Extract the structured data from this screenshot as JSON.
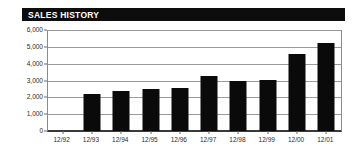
{
  "panel": {
    "title": "SALES HISTORY",
    "title_bar_color": "#0d0d0d",
    "title_text_color": "#ffffff",
    "background": "#ffffff"
  },
  "chart_data": {
    "type": "bar",
    "title": "SALES HISTORY",
    "xlabel": "",
    "ylabel": "",
    "categories": [
      "12/92",
      "12/93",
      "12/94",
      "12/95",
      "12/96",
      "12/97",
      "12/98",
      "12/99",
      "12/00",
      "12/01"
    ],
    "values": [
      0,
      2200,
      2350,
      2500,
      2550,
      3250,
      3000,
      3050,
      4600,
      5200
    ],
    "ylim": [
      0,
      6000
    ],
    "ytick_labels": [
      "0",
      "1,000",
      "2,000",
      "3,000",
      "4,000",
      "5,000",
      "6,000"
    ],
    "ytick_values": [
      0,
      1000,
      2000,
      3000,
      4000,
      5000,
      6000
    ],
    "grid": true,
    "legend": false,
    "bar_color": "#0a0a0a",
    "gridline_color": "#9a9a9a",
    "axis_color": "#3a3a3a"
  }
}
